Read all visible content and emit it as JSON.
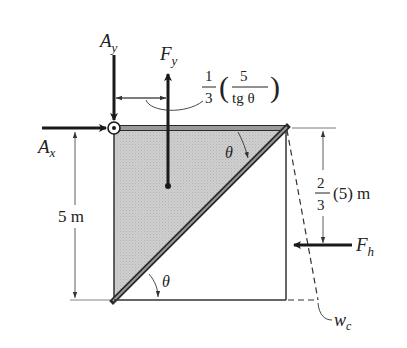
{
  "diagram": {
    "type": "free-body-diagram",
    "colors": {
      "line": "#2a2a2a",
      "shade": "#c9c9c9",
      "background": "#ffffff"
    },
    "forces": {
      "Ay": {
        "main": "A",
        "sub": "y",
        "direction": "down"
      },
      "Ax": {
        "main": "A",
        "sub": "x",
        "direction": "right"
      },
      "Fy": {
        "main": "F",
        "sub": "y",
        "direction": "up"
      },
      "Fh": {
        "main": "F",
        "sub": "h",
        "direction": "left"
      }
    },
    "dimensions": {
      "top_offset": {
        "coef_num": "1",
        "coef_den": "3",
        "inner_num": "5",
        "inner_den": "tg θ",
        "open": "(",
        "close": ")"
      },
      "height": {
        "text": "5 m"
      },
      "fh_depth": {
        "num": "2",
        "den": "3",
        "rest": "(5) m"
      }
    },
    "angles": {
      "top": "θ",
      "bottom": "θ"
    },
    "labels": {
      "wc": {
        "main": "w",
        "sub": "c"
      }
    }
  }
}
